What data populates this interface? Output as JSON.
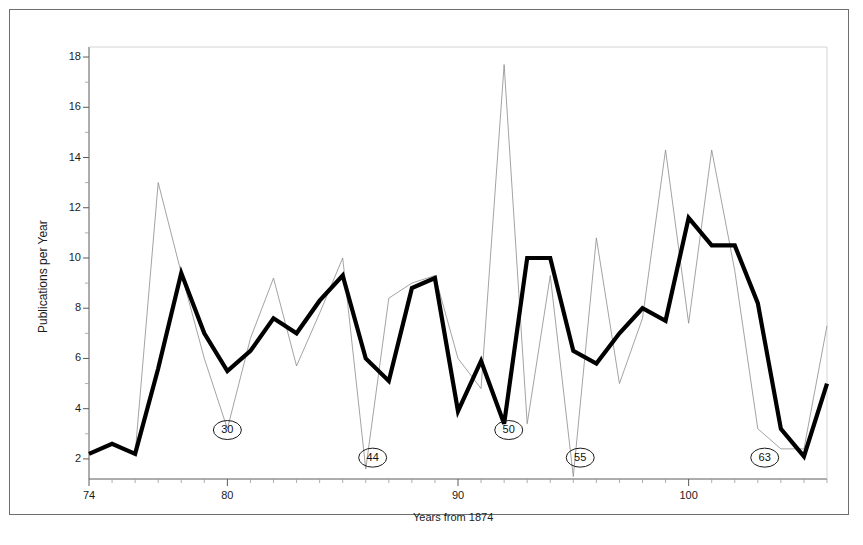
{
  "chart_data": {
    "type": "line",
    "title": "",
    "xlabel": "Years from 1874",
    "ylabel": "Publications per Year",
    "xlim": [
      74,
      106
    ],
    "ylim": [
      1.2,
      18.4
    ],
    "grid": false,
    "legend": null,
    "x_ticks_major": [
      74,
      80,
      90,
      100
    ],
    "x_tick_labels": [
      "74",
      "80",
      "90",
      "100"
    ],
    "x_ticks_minor_step": 1,
    "y_ticks_major": [
      2,
      4,
      6,
      8,
      10,
      12,
      14,
      16,
      18
    ],
    "y_tick_labels": [
      "2",
      "4",
      "6",
      "8",
      "10",
      "12",
      "14",
      "16",
      "18"
    ],
    "y_ticks_minor": [
      3,
      5,
      7,
      9,
      11,
      13,
      15,
      17
    ],
    "series": [
      {
        "name": "smoothed-thick-curve",
        "style": "thick-solid-black",
        "color": "#000000",
        "linewidth": 4.2,
        "x": [
          74,
          75,
          76,
          77,
          78,
          79,
          80,
          81,
          82,
          83,
          84,
          85,
          86,
          87,
          88,
          89,
          90,
          91,
          92,
          93,
          94,
          95,
          96,
          97,
          98,
          99,
          100,
          101,
          102,
          103,
          104,
          105,
          106
        ],
        "values": [
          2.2,
          2.6,
          2.2,
          5.6,
          9.4,
          7.0,
          5.5,
          6.3,
          7.6,
          7.0,
          8.3,
          9.3,
          6.0,
          5.1,
          8.8,
          9.2,
          3.9,
          5.9,
          3.4,
          10.0,
          10.0,
          6.3,
          5.8,
          7.0,
          8.0,
          7.5,
          11.6,
          10.5,
          10.5,
          8.2,
          3.2,
          2.1,
          5.0
        ]
      },
      {
        "name": "raw-thin-curve",
        "style": "thin-solid-gray",
        "color": "#8c8c8c",
        "linewidth": 0.8,
        "x": [
          74,
          75,
          76,
          77,
          78,
          79,
          80,
          81,
          82,
          83,
          84,
          85,
          86,
          87,
          88,
          89,
          90,
          91,
          92,
          93,
          94,
          95,
          96,
          97,
          98,
          99,
          100,
          101,
          102,
          103,
          104,
          105,
          106
        ],
        "values": [
          2.2,
          2.6,
          2.2,
          13.0,
          9.4,
          6.0,
          3.2,
          6.8,
          9.2,
          5.7,
          7.8,
          10.0,
          1.6,
          8.4,
          9.0,
          9.3,
          6.0,
          4.8,
          17.7,
          3.4,
          9.3,
          1.3,
          10.8,
          5.0,
          7.6,
          14.3,
          7.4,
          14.3,
          9.5,
          3.2,
          2.4,
          2.4,
          7.3
        ]
      }
    ],
    "annotations": [
      {
        "label": "30",
        "x": 80.0,
        "y": 3.15,
        "shape": "ellipse",
        "points_to": "thin-curve-minimum"
      },
      {
        "label": "44",
        "x": 86.3,
        "y": 2.05,
        "shape": "ellipse",
        "points_to": "thin-curve-minimum"
      },
      {
        "label": "50",
        "x": 92.2,
        "y": 3.15,
        "shape": "ellipse",
        "points_to": "thick-curve-minimum"
      },
      {
        "label": "55",
        "x": 95.3,
        "y": 2.05,
        "shape": "ellipse",
        "points_to": "thin-curve-minimum"
      },
      {
        "label": "63",
        "x": 103.3,
        "y": 2.05,
        "shape": "ellipse",
        "points_to": "thick-curve-minimum"
      }
    ]
  },
  "axes": {
    "ylabel": "Publications per Year",
    "xlabel": "Years from 1874",
    "y_tick_labels": [
      "18",
      "16",
      "14",
      "12",
      "10",
      "8",
      "6",
      "4",
      "2"
    ],
    "x_tick_labels": [
      "74",
      "80",
      "90",
      "100"
    ]
  },
  "annotation_labels": [
    "30",
    "44",
    "50",
    "55",
    "63"
  ],
  "colors": {
    "frame": "#6e6e6e",
    "axis": "#5a5a5a",
    "thick_line": "#000000",
    "thin_line": "#8c8c8c",
    "text": "#1a1a1a",
    "background": "#ffffff"
  }
}
